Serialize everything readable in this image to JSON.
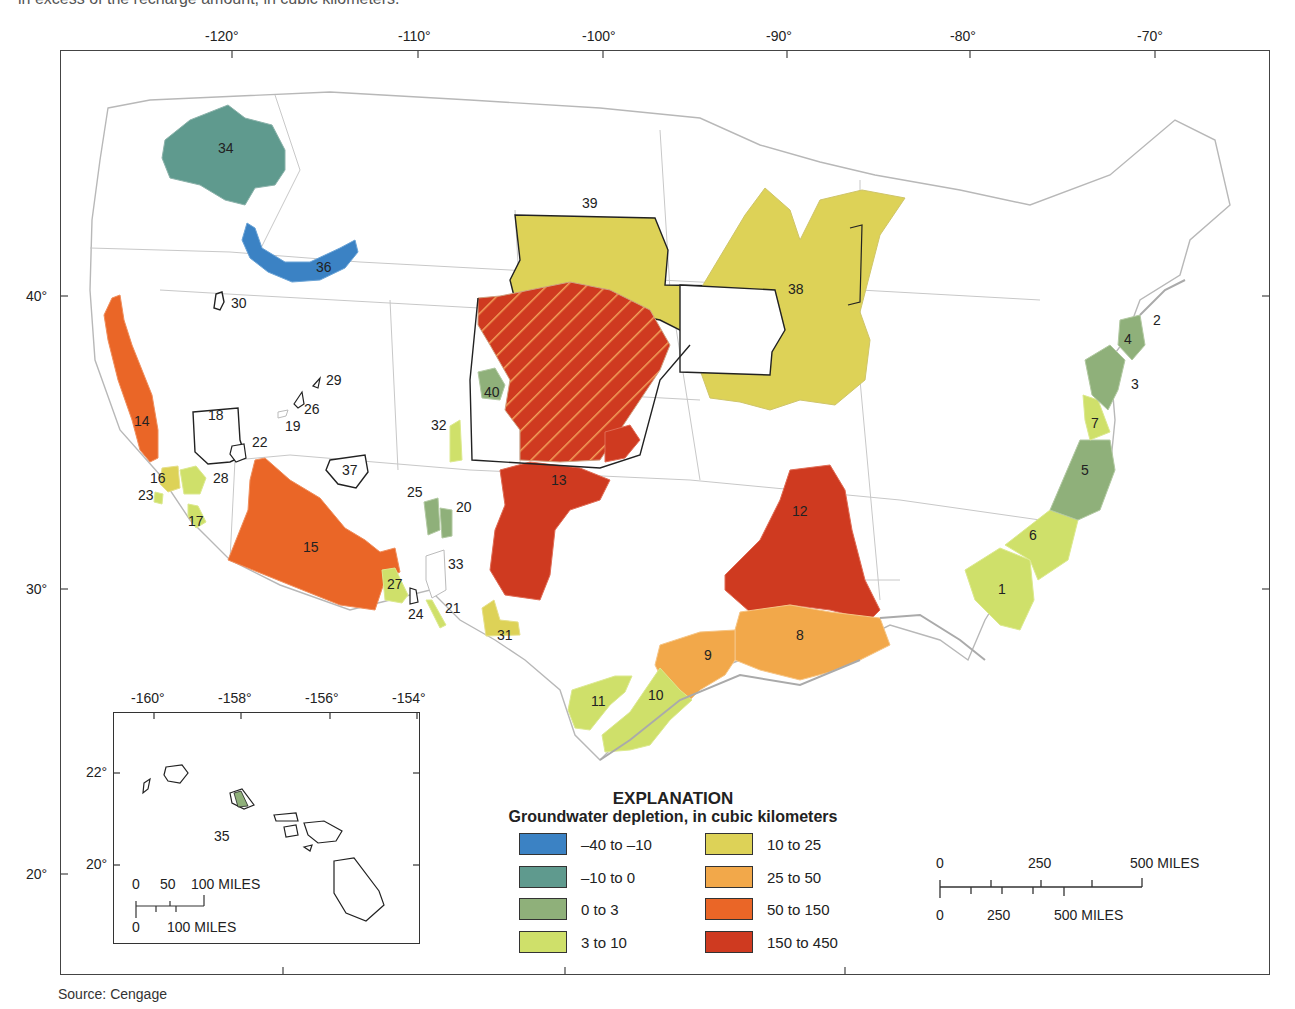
{
  "caption": "in excess of the recharge amount, in cubic kilometers.",
  "map": {
    "longitude_ticks": [
      "-120°",
      "-110°",
      "-100°",
      "-90°",
      "-80°",
      "-70°"
    ],
    "latitude_ticks": [
      "40°",
      "30°"
    ],
    "latitude_ticks_lower": [
      "20°"
    ]
  },
  "legend": {
    "title": "EXPLANATION",
    "subtitle": "Groundwater depletion, in cubic kilometers",
    "items": [
      {
        "label": "–40 to –10",
        "color": "#3b82c4"
      },
      {
        "label": "–10 to 0",
        "color": "#5f9a8e"
      },
      {
        "label": "0 to 3",
        "color": "#8fb07a"
      },
      {
        "label": "3 to 10",
        "color": "#cfe06a"
      },
      {
        "label": "10 to 25",
        "color": "#ddd257"
      },
      {
        "label": "25 to 50",
        "color": "#f2a84a"
      },
      {
        "label": "50 to 150",
        "color": "#ea6627"
      },
      {
        "label": "150 to 450",
        "color": "#cf3a20"
      }
    ]
  },
  "scale_bar": {
    "top_labels": [
      "0",
      "250",
      "500 MILES"
    ],
    "bottom_labels": [
      "0",
      "250",
      "500 MILES"
    ]
  },
  "inset": {
    "longitude_ticks": [
      "-160°",
      "-158°",
      "-156°",
      "-154°"
    ],
    "latitude_ticks": [
      "22°",
      "20°"
    ],
    "scale_top_labels": [
      "0",
      "50",
      "100 MILES"
    ],
    "scale_bottom_labels": [
      "0",
      "100 MILES"
    ],
    "region_label": "35"
  },
  "regions": [
    {
      "id": "1",
      "class": "3 to 10"
    },
    {
      "id": "2",
      "class": "none"
    },
    {
      "id": "3",
      "class": "0 to 3"
    },
    {
      "id": "4",
      "class": "0 to 3"
    },
    {
      "id": "5",
      "class": "0 to 3"
    },
    {
      "id": "6",
      "class": "3 to 10"
    },
    {
      "id": "7",
      "class": "3 to 10"
    },
    {
      "id": "8",
      "class": "25 to 50"
    },
    {
      "id": "9",
      "class": "25 to 50"
    },
    {
      "id": "10",
      "class": "3 to 10"
    },
    {
      "id": "11",
      "class": "3 to 10"
    },
    {
      "id": "12",
      "class": "150 to 450"
    },
    {
      "id": "13",
      "class": "150 to 450"
    },
    {
      "id": "14",
      "class": "50 to 150"
    },
    {
      "id": "15",
      "class": "50 to 150"
    },
    {
      "id": "16",
      "class": "10 to 25"
    },
    {
      "id": "17",
      "class": "3 to 10"
    },
    {
      "id": "18",
      "class": "none"
    },
    {
      "id": "19",
      "class": "none"
    },
    {
      "id": "20",
      "class": "0 to 3"
    },
    {
      "id": "21",
      "class": "3 to 10"
    },
    {
      "id": "22",
      "class": "none"
    },
    {
      "id": "23",
      "class": "3 to 10"
    },
    {
      "id": "24",
      "class": "none"
    },
    {
      "id": "25",
      "class": "0 to 3"
    },
    {
      "id": "26",
      "class": "none"
    },
    {
      "id": "27",
      "class": "3 to 10"
    },
    {
      "id": "28",
      "class": "3 to 10"
    },
    {
      "id": "29",
      "class": "none"
    },
    {
      "id": "30",
      "class": "none"
    },
    {
      "id": "31",
      "class": "10 to 25"
    },
    {
      "id": "32",
      "class": "3 to 10"
    },
    {
      "id": "33",
      "class": "none"
    },
    {
      "id": "34",
      "class": "–10 to 0"
    },
    {
      "id": "35",
      "class": "0 to 3"
    },
    {
      "id": "36",
      "class": "–40 to –10"
    },
    {
      "id": "37",
      "class": "none"
    },
    {
      "id": "38",
      "class": "10 to 25"
    },
    {
      "id": "39",
      "class": "10 to 25"
    },
    {
      "id": "40",
      "class": "0 to 3"
    }
  ],
  "source": "Source: Cengage"
}
